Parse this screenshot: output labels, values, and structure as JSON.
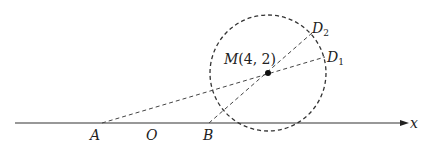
{
  "diagram": {
    "axis": {
      "label": "x",
      "y": 123,
      "x_start": 15,
      "x_end": 407
    },
    "circle": {
      "cx": 268,
      "cy": 73,
      "r": 58,
      "style": "dashed"
    },
    "center": {
      "name": "M",
      "coords": "(4, 2)",
      "x": 268,
      "y": 73
    },
    "points": [
      {
        "name": "A",
        "x": 102,
        "y": 123
      },
      {
        "name": "O",
        "x": 152,
        "y": 123
      },
      {
        "name": "B",
        "x": 209,
        "y": 123
      },
      {
        "name": "D",
        "sub": "1",
        "x": 325,
        "y": 57
      },
      {
        "name": "D",
        "sub": "2",
        "x": 312,
        "y": 33
      }
    ],
    "segments": [
      {
        "from": "A",
        "to": "D1",
        "style": "dashed"
      },
      {
        "from": "B",
        "to": "D2",
        "style": "dashed"
      }
    ],
    "labels": {
      "M": "M",
      "M_coords": "(4, 2)",
      "A": "A",
      "O": "O",
      "B": "B",
      "D1_main": "D",
      "D1_sub": "1",
      "D2_main": "D",
      "D2_sub": "2",
      "x_axis": "x"
    }
  }
}
